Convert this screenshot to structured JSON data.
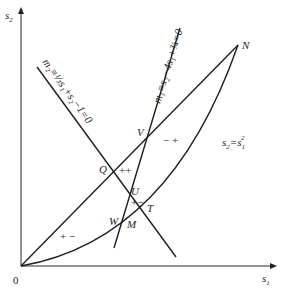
{
  "diagram": {
    "axes": {
      "x_label": "s",
      "x_label_sub": "1",
      "y_label": "s",
      "y_label_sub": "2",
      "origin_label": "0"
    },
    "curve_label": {
      "lhs": "s",
      "lhs_sub": "2",
      "eq": "=s",
      "rhs_sub": "1",
      "rhs_sup": "2"
    },
    "line_m1_label": "m₁≡s₂−4s₁+¾=0",
    "line_m2_label": "m₂≡⅓s₁+s₂−1=0",
    "points": {
      "N": "N",
      "V": "V",
      "Q": "Q",
      "U": "U",
      "T": "T",
      "W": "W",
      "M": "M"
    },
    "region_signs": {
      "upper_right": "− +",
      "center": "++",
      "lower_left": "+ −",
      "small_triangle": "+−"
    },
    "colors": {
      "ink": "#1e1e1e",
      "background": "#ffffff"
    }
  }
}
